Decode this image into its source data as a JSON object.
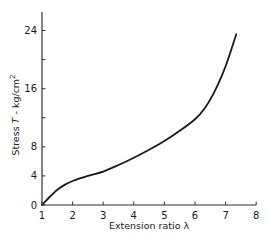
{
  "chart_data": {
    "type": "line",
    "title": "",
    "xlabel": "Extension ratio λ",
    "ylabel": "Stress T - kg/cm²",
    "ylabel_parts": {
      "prefix": "Stress ",
      "symbol": "T",
      "suffix": " - kg/cm",
      "sup": "2"
    },
    "xlim": [
      1,
      8
    ],
    "ylim": [
      0,
      25
    ],
    "x_ticks": [
      1,
      2,
      3,
      4,
      5,
      6,
      7,
      8
    ],
    "y_ticks": [
      0,
      4,
      8,
      12,
      16,
      20,
      24
    ],
    "y_tick_labels": [
      "0",
      "4",
      "8",
      "",
      "16",
      "",
      "24"
    ],
    "grid": false,
    "legend": null,
    "series": [
      {
        "name": "Stress-strain curve",
        "x": [
          1.0,
          1.25,
          1.5,
          1.75,
          2.0,
          2.5,
          3.0,
          3.5,
          4.0,
          4.5,
          5.0,
          5.5,
          6.0,
          6.3,
          6.6,
          6.9,
          7.1,
          7.35
        ],
        "y": [
          0.0,
          1.1,
          2.1,
          2.8,
          3.3,
          4.0,
          4.6,
          5.5,
          6.5,
          7.6,
          8.8,
          10.2,
          11.8,
          13.2,
          15.3,
          18.0,
          20.3,
          23.5
        ]
      }
    ]
  },
  "axes": {
    "x_title": "Extension ratio λ",
    "y_title_prefix": "Stress ",
    "y_title_symbol": "T",
    "y_title_suffix": " - kg/cm",
    "y_title_sup": "2"
  },
  "colors": {
    "line": "#1a1a1a",
    "axis": "#333333",
    "background": "#ffffff"
  }
}
